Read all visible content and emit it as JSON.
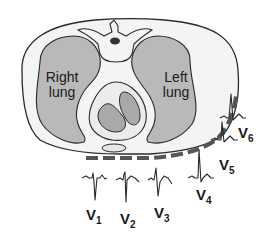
{
  "diagram": {
    "type": "anatomical cross-section",
    "colors": {
      "background": "#ffffff",
      "torso_fill": "#f4f4f4",
      "lung_fill": "#b9b9b9",
      "heart_outer_fill": "#ececec",
      "heart_chamber_fill": "#a9a9a9",
      "outline": "#2a2a2a",
      "electrode_strip": "#555555"
    },
    "labels": {
      "right_lung_line1": "Right",
      "right_lung_line2": "lung",
      "left_lung_line1": "Left",
      "left_lung_line2": "lung"
    },
    "structures": [
      "torso",
      "spine",
      "right-lung",
      "left-lung",
      "heart",
      "sternum",
      "electrode-strip"
    ],
    "leads": [
      {
        "name": "V",
        "sub": "1",
        "waveform": "rS (small r, deep S)"
      },
      {
        "name": "V",
        "sub": "2",
        "waveform": "rS (deep S)"
      },
      {
        "name": "V",
        "sub": "3",
        "waveform": "RS (transition)"
      },
      {
        "name": "V",
        "sub": "4",
        "waveform": "tall R, small s"
      },
      {
        "name": "V",
        "sub": "5",
        "waveform": "tall R"
      },
      {
        "name": "V",
        "sub": "6",
        "waveform": "tall R, qR"
      }
    ]
  }
}
